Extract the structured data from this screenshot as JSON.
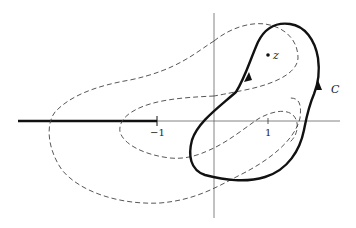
{
  "figure": {
    "type": "complex-plane contour diagram",
    "colors": {
      "background": "#ffffff",
      "axis": "#555555",
      "contour": "#111111",
      "dashed": "#444444"
    },
    "axes": {
      "real_axis": true,
      "imaginary_axis": true,
      "ticks": [
        {
          "value": -1,
          "label": "−1"
        },
        {
          "value": 1,
          "label": "1"
        }
      ]
    },
    "branch_cut": {
      "description": "thick segment along negative real axis from -infinity to -1",
      "end_label": "−1"
    },
    "point": {
      "label": "z",
      "position_approx": [
        1,
        1.2
      ]
    },
    "contour": {
      "label": "C",
      "style": "thick solid closed curve",
      "arrows": 2,
      "orientation": "counterclockwise"
    },
    "dashed_curves": [
      {
        "name": "outer-dashed-curve",
        "description": "large dashed closed curve enclosing the branch point region, crossing the branch cut"
      },
      {
        "name": "inner-dashed-curve",
        "description": "smaller dashed closed curve around -1 to 1"
      }
    ]
  }
}
